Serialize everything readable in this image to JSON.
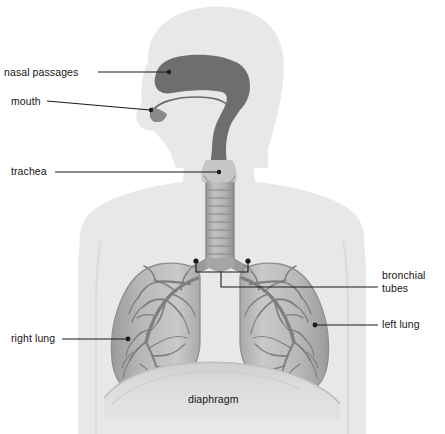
{
  "figure": {
    "background_color": "#ffffff",
    "body_silhouette_color": "#e8e8e8",
    "lung_color": "#b4b4b4",
    "airway_color": "#6e6e6e",
    "bronchial_tree_color": "#7a7a7a",
    "leader_line_color": "#1a1a1a",
    "label_text_color": "#151515"
  },
  "labels": {
    "nasal_passages": "nasal passages",
    "mouth": "mouth",
    "trachea": "trachea",
    "right_lung": "right lung",
    "left_lung": "left lung",
    "bronchial_tubes_line1": "bronchial",
    "bronchial_tubes_line2": "tubes",
    "diaphragm": "diaphragm"
  }
}
